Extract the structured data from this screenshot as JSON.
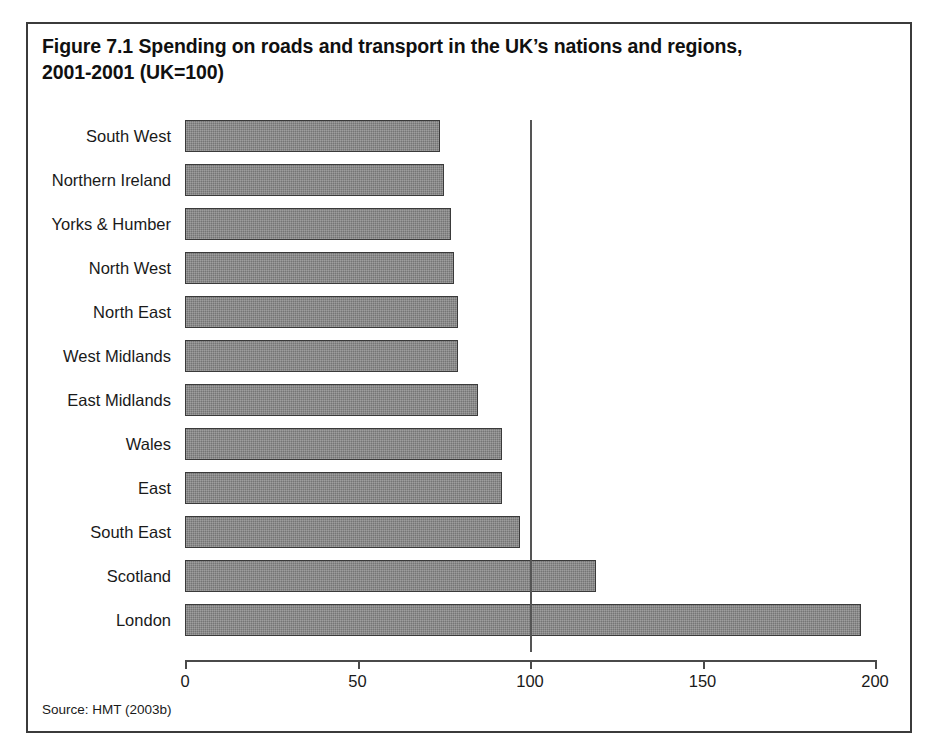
{
  "figure": {
    "title_line1": "Figure 7.1 Spending on roads and transport in the UK’s nations and regions,",
    "title_line2": "2001-2001 (UK=100)",
    "source_note": "Source: HMT (2003b)"
  },
  "style": {
    "bar_fill": "#757575",
    "bar_outline": "#3a3a3a",
    "frame_color": "#3b3b3b",
    "axis_color": "#4a4a4a",
    "reference_line_color": "#555555",
    "background": "#ffffff",
    "text_color": "#1a1a1a"
  },
  "chart_data": {
    "type": "bar",
    "orientation": "horizontal",
    "title": "Figure 7.1 Spending on roads and transport in the UK’s nations and regions, 2001-2001 (UK=100)",
    "subtitle": "",
    "xlabel": "",
    "ylabel": "",
    "xlim": [
      0,
      200
    ],
    "ylim": null,
    "grid": false,
    "legend": null,
    "legend_position": "none",
    "xticks": [
      0,
      50,
      100,
      150,
      200
    ],
    "xtick_labels": [
      "0",
      "50",
      "100",
      "150",
      "200"
    ],
    "reference_lines": [
      {
        "axis": "x",
        "value": 100,
        "label": "UK=100"
      }
    ],
    "categories": [
      "South West",
      "Northern Ireland",
      "Yorks & Humber",
      "North West",
      "North East",
      "West Midlands",
      "East Midlands",
      "Wales",
      "East",
      "South East",
      "Scotland",
      "London"
    ],
    "values": [
      74,
      75,
      77,
      78,
      79,
      79,
      85,
      92,
      92,
      97,
      119,
      196
    ],
    "series": [
      {
        "name": "Spending on roads and transport (UK=100)",
        "values": [
          74,
          75,
          77,
          78,
          79,
          79,
          85,
          92,
          92,
          97,
          119,
          196
        ]
      }
    ],
    "source": "HMT (2003b)"
  }
}
